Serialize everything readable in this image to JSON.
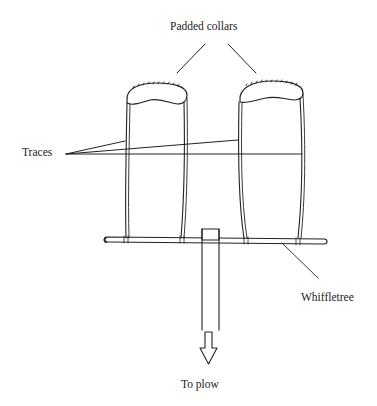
{
  "figure": {
    "type": "labeled line drawing",
    "labels": {
      "collars": "Padded collars",
      "traces": "Traces",
      "whiffletree": "Whiffletree",
      "plow": "To plow"
    },
    "components": [
      {
        "name": "left-padded-collar"
      },
      {
        "name": "right-padded-collar"
      },
      {
        "name": "traces",
        "count": 3
      },
      {
        "name": "whiffletree"
      },
      {
        "name": "center-hitch-post"
      },
      {
        "name": "direction-arrow",
        "direction": "down"
      }
    ],
    "colors": {
      "stroke": "#222222",
      "background": "#ffffff"
    }
  }
}
